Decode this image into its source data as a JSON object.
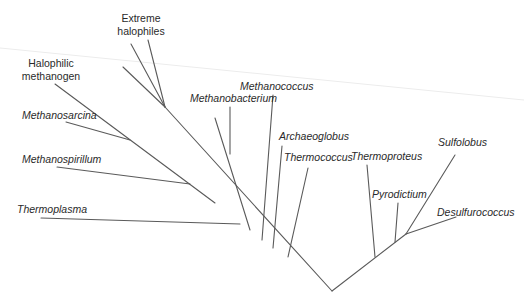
{
  "diagram": {
    "type": "phylogenetic-tree",
    "domain_group": "Archaea",
    "root": {
      "x": 332,
      "y": 291
    },
    "colors": {
      "branch": "#5a5a5a",
      "label": "#2a2a2a",
      "background": "#ffffff"
    },
    "labels": {
      "extreme_halophiles_line1": "Extreme",
      "extreme_halophiles_line2": "halophiles",
      "halophilic_methanogen_line1": "Halophilic",
      "halophilic_methanogen_line2": "methanogen",
      "methanosarcina": "Methanosarcina",
      "methanospirillum": "Methanospirillum",
      "thermoplasma": "Thermoplasma",
      "methanobacterium": "Methanobacterium",
      "methanococcus": "Methanococcus",
      "archaeoglobus": "Archaeoglobus",
      "thermococcus": "Thermococcus",
      "thermoproteus": "Thermoproteus",
      "pyrodictium": "Pyrodictium",
      "sulfolobus": "Sulfolobus",
      "desulfurococcus": "Desulfurococcus"
    },
    "taxa": [
      {
        "name": "Extreme halophiles",
        "italic": false
      },
      {
        "name": "Halophilic methanogen",
        "italic": false
      },
      {
        "name": "Methanosarcina",
        "italic": true
      },
      {
        "name": "Methanospirillum",
        "italic": true
      },
      {
        "name": "Thermoplasma",
        "italic": true
      },
      {
        "name": "Methanobacterium",
        "italic": true
      },
      {
        "name": "Methanococcus",
        "italic": true
      },
      {
        "name": "Archaeoglobus",
        "italic": true
      },
      {
        "name": "Thermococcus",
        "italic": true
      },
      {
        "name": "Thermoproteus",
        "italic": true
      },
      {
        "name": "Pyrodictium",
        "italic": true
      },
      {
        "name": "Sulfolobus",
        "italic": true
      },
      {
        "name": "Desulfurococcus",
        "italic": true
      }
    ],
    "branches": [
      {
        "id": "trunk-left",
        "x1": 332,
        "y1": 291,
        "x2": 165,
        "y2": 107
      },
      {
        "id": "trunk-right",
        "x1": 332,
        "y1": 291,
        "x2": 406,
        "y2": 234
      },
      {
        "id": "extreme-halophile-a",
        "x1": 131,
        "y1": 44,
        "x2": 165,
        "y2": 107
      },
      {
        "id": "extreme-halophile-b",
        "x1": 148,
        "y1": 40,
        "x2": 165,
        "y2": 107
      },
      {
        "id": "extreme-halophile-c",
        "x1": 123,
        "y1": 67,
        "x2": 165,
        "y2": 107
      },
      {
        "id": "methanogen-clade",
        "x1": 55,
        "y1": 84,
        "x2": 215,
        "y2": 203
      },
      {
        "id": "methanosarcina",
        "x1": 66,
        "y1": 122,
        "x2": 130,
        "y2": 140
      },
      {
        "id": "methanospirillum",
        "x1": 57,
        "y1": 167,
        "x2": 190,
        "y2": 184
      },
      {
        "id": "thermoplasma",
        "x1": 41,
        "y1": 218,
        "x2": 240,
        "y2": 224
      },
      {
        "id": "methanobacterium-clade",
        "x1": 215,
        "y1": 118,
        "x2": 250,
        "y2": 230
      },
      {
        "id": "methanobacterium",
        "x1": 230,
        "y1": 107,
        "x2": 230,
        "y2": 154
      },
      {
        "id": "methanococcus",
        "x1": 273,
        "y1": 95,
        "x2": 262,
        "y2": 240
      },
      {
        "id": "archaeoglobus",
        "x1": 282,
        "y1": 146,
        "x2": 273,
        "y2": 248
      },
      {
        "id": "thermococcus",
        "x1": 308,
        "y1": 168,
        "x2": 288,
        "y2": 257
      },
      {
        "id": "thermoproteus",
        "x1": 367,
        "y1": 165,
        "x2": 375,
        "y2": 257
      },
      {
        "id": "pyrodictium",
        "x1": 398,
        "y1": 203,
        "x2": 395,
        "y2": 242
      },
      {
        "id": "sulfolobus",
        "x1": 455,
        "y1": 155,
        "x2": 406,
        "y2": 234
      },
      {
        "id": "desulfurococcus",
        "x1": 456,
        "y1": 217,
        "x2": 406,
        "y2": 234
      }
    ]
  }
}
